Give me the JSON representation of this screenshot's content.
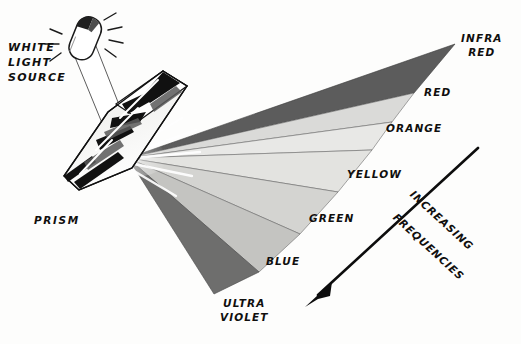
{
  "diagram": {
    "background_color": "#fdfdfc",
    "ink_color": "#100f0e"
  },
  "labels": {
    "white_light_source": "WHITE\nLIGHT\nSOURCE",
    "prism": "PRISM",
    "increasing": "INCREASING",
    "frequencies": "FREQUENCIES"
  },
  "spectrum": {
    "apex": {
      "x": 128,
      "y": 158
    },
    "bands": [
      {
        "name": "infra-red",
        "label": "INFRA\nRED",
        "fill": "#5c5c5c",
        "label_x": 462,
        "label_y": 36,
        "outer_top_x": 455,
        "outer_top_y": 44,
        "outer_bot_x": 414,
        "outer_bot_y": 93
      },
      {
        "name": "red",
        "label": "RED",
        "fill": "#d8d8d6",
        "label_x": 424,
        "label_y": 90,
        "outer_top_x": 414,
        "outer_top_y": 93,
        "outer_bot_x": 392,
        "outer_bot_y": 122
      },
      {
        "name": "orange",
        "label": "ORANGE",
        "fill": "#e6e6e4",
        "label_x": 386,
        "label_y": 125,
        "outer_top_x": 392,
        "outer_top_y": 122,
        "outer_bot_x": 372,
        "outer_bot_y": 150
      },
      {
        "name": "yellow",
        "label": "YELLOW",
        "fill": "#e2e2df",
        "label_x": 347,
        "label_y": 172,
        "outer_top_x": 372,
        "outer_top_y": 150,
        "outer_bot_x": 338,
        "outer_bot_y": 192
      },
      {
        "name": "green",
        "label": "GREEN",
        "fill": "#d3d3d0",
        "label_x": 309,
        "label_y": 216,
        "outer_top_x": 338,
        "outer_top_y": 192,
        "outer_bot_x": 300,
        "outer_bot_y": 234
      },
      {
        "name": "blue",
        "label": "BLUE",
        "fill": "#c3c3c0",
        "label_x": 267,
        "label_y": 258,
        "outer_top_x": 300,
        "outer_top_y": 234,
        "outer_bot_x": 259,
        "outer_bot_y": 272
      },
      {
        "name": "ultra-violet",
        "label": "ULTRA\nVIOLET",
        "fill": "#6e6e6d",
        "label_x": 221,
        "label_y": 300,
        "outer_top_x": 259,
        "outer_top_y": 272,
        "outer_bot_x": 214,
        "outer_bot_y": 294
      }
    ]
  },
  "arrow": {
    "name": "increasing-frequencies-arrow",
    "start": {
      "x": 478,
      "y": 148
    },
    "end": {
      "x": 307,
      "y": 305
    },
    "rotation_deg": 42.6,
    "text_line1_offset": 66,
    "text_line2_offset": 96
  },
  "light_source": {
    "name": "lamp",
    "beam_from": {
      "x": 80,
      "y": 40
    },
    "beam_to": {
      "x": 128,
      "y": 158
    }
  },
  "prism": {
    "name": "glass-prism",
    "top_apex": {
      "x": 163,
      "y": 71
    },
    "right_corner": {
      "x": 186,
      "y": 85
    },
    "bottom_corner": {
      "x": 78,
      "y": 190
    }
  }
}
